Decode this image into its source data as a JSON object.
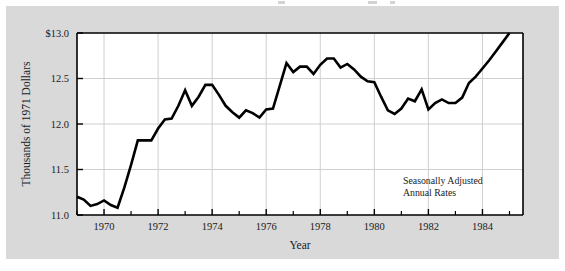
{
  "figure": {
    "background_color": "#d9d9d9",
    "plot_background_color": "#ffffff",
    "line_color": "#000000",
    "grid_color": "#cfcfcf",
    "axis_color": "#000000"
  },
  "annotation": {
    "line1": "Seasonally Adjusted",
    "line2": "Annual Rates"
  },
  "chart_data": {
    "type": "line",
    "title": "",
    "xlabel": "Year",
    "ylabel": "Thousands of 1971 Dollars",
    "xlim": [
      1969.0,
      1985.5
    ],
    "ylim": [
      11.0,
      13.0
    ],
    "grid": true,
    "legend": "none",
    "xticks": [
      1970,
      1972,
      1974,
      1976,
      1978,
      1980,
      1982,
      1984
    ],
    "xtick_labels": [
      "1970",
      "1972",
      "1974",
      "1976",
      "1978",
      "1980",
      "1982",
      "1984"
    ],
    "xminor_ticks": [
      1969,
      1971,
      1973,
      1975,
      1977,
      1979,
      1981,
      1983,
      1985
    ],
    "yticks": [
      11.0,
      11.5,
      12.0,
      12.5,
      13.0
    ],
    "ytick_labels": [
      "11.0",
      "11.5",
      "12.0",
      "12.5",
      "$13.0"
    ],
    "series": [
      {
        "name": "Real disposable income per capita",
        "x": [
          1969.0,
          1969.25,
          1969.5,
          1969.75,
          1970.0,
          1970.25,
          1970.5,
          1970.75,
          1971.0,
          1971.25,
          1971.5,
          1971.75,
          1972.0,
          1972.25,
          1972.5,
          1972.75,
          1973.0,
          1973.25,
          1973.5,
          1973.75,
          1974.0,
          1974.25,
          1974.5,
          1974.75,
          1975.0,
          1975.25,
          1975.5,
          1975.75,
          1976.0,
          1976.25,
          1976.5,
          1976.75,
          1977.0,
          1977.25,
          1977.5,
          1977.75,
          1978.0,
          1978.25,
          1978.5,
          1978.75,
          1979.0,
          1979.25,
          1979.5,
          1979.75,
          1980.0,
          1980.25,
          1980.5,
          1980.75,
          1981.0,
          1981.25,
          1981.5,
          1981.75,
          1982.0,
          1982.25,
          1982.5,
          1982.75,
          1983.0,
          1983.25,
          1983.5,
          1983.75,
          1984.0,
          1984.25,
          1984.5,
          1984.75,
          1985.0
        ],
        "y": [
          11.2,
          11.17,
          11.1,
          11.12,
          11.16,
          11.11,
          11.08,
          11.3,
          11.55,
          11.82,
          11.82,
          11.82,
          11.95,
          12.05,
          12.06,
          12.2,
          12.37,
          12.2,
          12.3,
          12.43,
          12.43,
          12.32,
          12.2,
          12.13,
          12.07,
          12.15,
          12.12,
          12.07,
          12.16,
          12.17,
          12.42,
          12.67,
          12.57,
          12.63,
          12.63,
          12.55,
          12.65,
          12.72,
          12.72,
          12.62,
          12.66,
          12.6,
          12.52,
          12.47,
          12.46,
          12.3,
          12.15,
          12.11,
          12.17,
          12.28,
          12.25,
          12.38,
          12.16,
          12.23,
          12.27,
          12.23,
          12.23,
          12.29,
          12.45,
          12.52,
          12.61,
          12.7,
          12.8,
          12.9,
          13.0
        ]
      }
    ]
  }
}
